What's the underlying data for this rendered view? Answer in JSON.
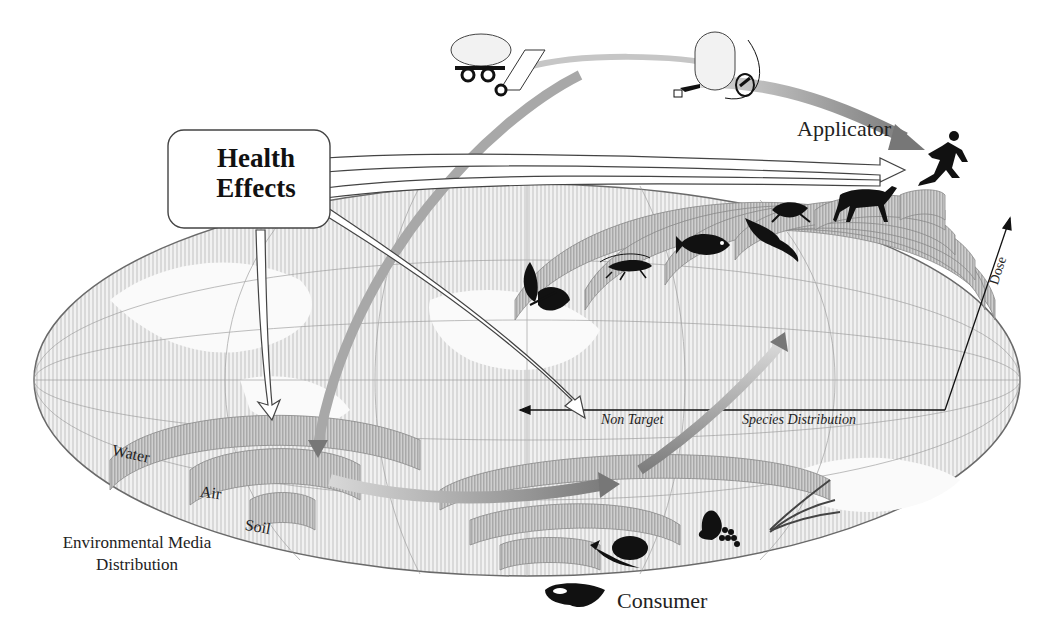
{
  "diagram": {
    "callout": {
      "line1": "Health",
      "line2": "Effects"
    },
    "labels": {
      "applicator": "Applicator",
      "consumer": "Consumer",
      "environmental_media_distribution": "Environmental Media Distribution",
      "non_target": "Non Target",
      "species_distribution": "Species Distribution",
      "dose_axis": "Dose"
    },
    "environmental_media": [
      "Water",
      "Air",
      "Soil"
    ],
    "non_target_species": [
      "plant",
      "grasshopper",
      "fish",
      "bird",
      "frog",
      "deer"
    ],
    "consumer_foods": [
      "meat",
      "vegetables",
      "fruit",
      "grain"
    ],
    "application_equipment": [
      "tank-trailer-sprayer",
      "backpack-sprayer"
    ],
    "colors": {
      "globe_fill": "#e6e6e6",
      "globe_stroke": "#6a6a6a",
      "ring_fill": "#bdbdbd",
      "flow_arrow": "#8c8c8c",
      "outline_arrow": "#ffffff",
      "silhouette": "#111111"
    }
  }
}
